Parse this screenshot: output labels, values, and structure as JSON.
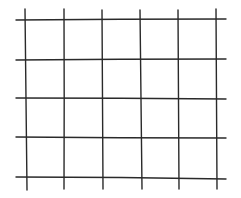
{
  "diagram": {
    "type": "grid",
    "style": "hand-drawn",
    "background": "#ffffff",
    "line_color": "#2a2a2a",
    "line_width": 1.4,
    "columns": 5,
    "rows": 4,
    "vertical_lines": [
      {
        "x_top": 25,
        "x_bottom": 27,
        "y1": 9,
        "y2": 190
      },
      {
        "x_top": 64,
        "x_bottom": 64,
        "y1": 9,
        "y2": 189
      },
      {
        "x_top": 102,
        "x_bottom": 103,
        "y1": 10,
        "y2": 189
      },
      {
        "x_top": 140,
        "x_bottom": 142,
        "y1": 10,
        "y2": 189
      },
      {
        "x_top": 178,
        "x_bottom": 179,
        "y1": 10,
        "y2": 189
      },
      {
        "x_top": 216,
        "x_bottom": 217,
        "y1": 9,
        "y2": 189
      }
    ],
    "horizontal_lines": [
      {
        "y_left": 20,
        "y_mid": 19,
        "y_right": 19,
        "x1": 16,
        "x2": 226
      },
      {
        "y_left": 60,
        "y_mid": 59,
        "y_right": 59,
        "x1": 16,
        "x2": 226
      },
      {
        "y_left": 98,
        "y_mid": 98,
        "y_right": 99,
        "x1": 16,
        "x2": 226
      },
      {
        "y_left": 137,
        "y_mid": 138,
        "y_right": 138,
        "x1": 16,
        "x2": 226
      },
      {
        "y_left": 177,
        "y_mid": 177,
        "y_right": 179,
        "x1": 16,
        "x2": 226
      }
    ]
  }
}
